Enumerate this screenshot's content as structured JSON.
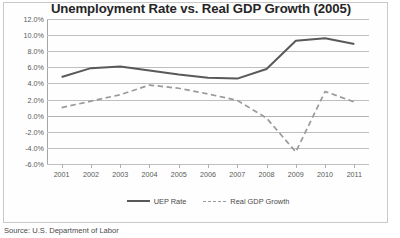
{
  "page": {
    "source_note": "Source: U.S. Department of Labor"
  },
  "chart_data": {
    "type": "line",
    "title": "Unemployment Rate vs. Real GDP Growth (2005)",
    "xlabel": "",
    "ylabel": "",
    "grid": true,
    "legend_position": "bottom",
    "ylim": [
      -6,
      12
    ],
    "ytick_step": 2,
    "ytick_labels": [
      "12.0%",
      "10.0%",
      "8.0%",
      "6.0%",
      "4.0%",
      "2.0%",
      "0.0%",
      "-2.0%",
      "-4.0%",
      "-6.0%"
    ],
    "ytick_values": [
      12,
      10,
      8,
      6,
      4,
      2,
      0,
      -2,
      -4,
      -6
    ],
    "categories": [
      "2001",
      "2002",
      "2003",
      "2004",
      "2005",
      "2006",
      "2007",
      "2008",
      "2009",
      "2010",
      "2011"
    ],
    "series": [
      {
        "name": "UEP Rate",
        "style": "solid",
        "color": "#595959",
        "values": [
          4.8,
          5.9,
          6.1,
          5.6,
          5.1,
          4.7,
          4.6,
          5.8,
          9.3,
          9.6,
          8.9
        ]
      },
      {
        "name": "Real GDP Growth",
        "style": "dashed",
        "color": "#9a9a9a",
        "values": [
          1.0,
          1.8,
          2.6,
          3.8,
          3.4,
          2.7,
          1.9,
          -0.3,
          -4.5,
          3.0,
          1.7
        ]
      }
    ]
  }
}
